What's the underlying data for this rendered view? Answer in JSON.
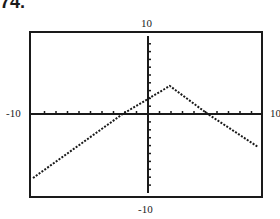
{
  "heading": "74.",
  "window_labels": {
    "ymax": "10",
    "ymin": "-10",
    "xmin": "-10",
    "xmax": "10"
  },
  "chart_data": {
    "type": "line",
    "title": "",
    "xlabel": "",
    "ylabel": "",
    "xlim": [
      -10,
      10
    ],
    "ylim": [
      -10,
      10
    ],
    "grid": false,
    "x_ticks_step": 1,
    "y_ticks_step": 1,
    "series": [
      {
        "name": "f(x)",
        "style": "dotted",
        "x": [
          -10,
          -2.2,
          1.9,
          5.2,
          9.6
        ],
        "y": [
          -8.1,
          0,
          3.6,
          0,
          -4.2
        ]
      }
    ],
    "annotations": [
      "Graphing calculator window [-10,10] by [-10,10]"
    ]
  }
}
